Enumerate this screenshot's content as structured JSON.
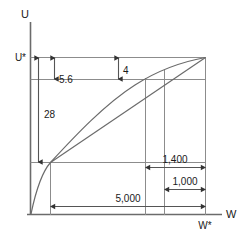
{
  "figure": {
    "type": "economics-utility-diagram",
    "axes": {
      "y_label": "U",
      "x_label": "W",
      "y_star_label": "U*",
      "x_star_label": "W*"
    },
    "annotations": [
      {
        "name": "u-star-to-certainty-equivalent",
        "label": "28",
        "orientation": "vertical",
        "value": 28
      },
      {
        "name": "utility-gap-small",
        "label": "5.6",
        "orientation": "vertical",
        "value": 5.6
      },
      {
        "name": "utility-gap-four",
        "label": "4",
        "orientation": "vertical",
        "value": 4
      },
      {
        "name": "wealth-span-main",
        "label": "5,000",
        "orientation": "horizontal",
        "value": 5000
      },
      {
        "name": "wealth-span-upper",
        "label": "1,400",
        "orientation": "horizontal",
        "value": 1400
      },
      {
        "name": "wealth-span-lower",
        "label": "1,000",
        "orientation": "horizontal",
        "value": 1000
      }
    ],
    "colors": {
      "stroke": "#4d4d4d",
      "text": "#1a1a1a",
      "background": "#ffffff"
    }
  }
}
